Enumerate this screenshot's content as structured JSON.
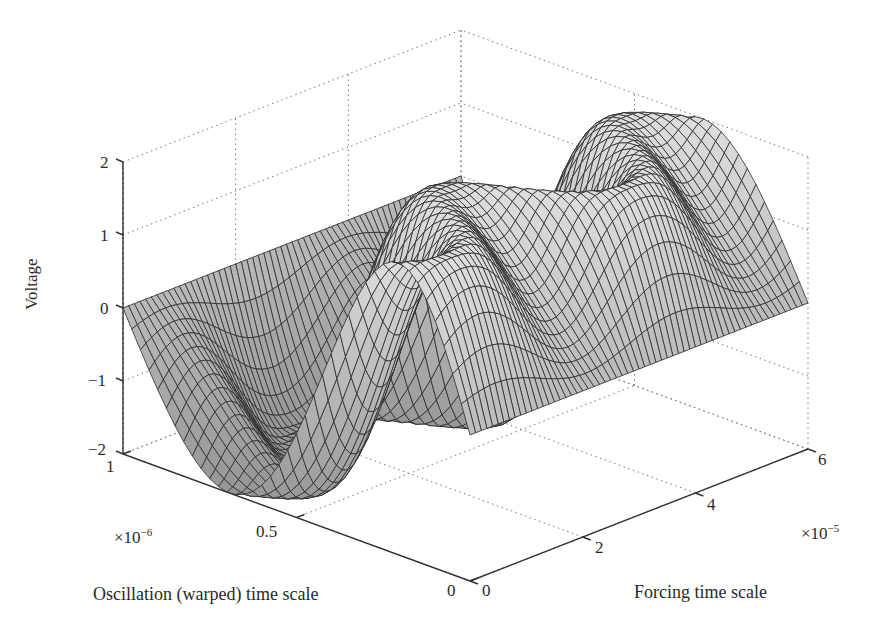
{
  "chart_data": {
    "type": "surface3d",
    "title": "",
    "xlabel": "Forcing time scale",
    "ylabel": "Oscillation (warped) time scale",
    "zlabel": "Voltage",
    "x_multiplier": "×10",
    "x_multiplier_exp": "−5",
    "y_multiplier": "×10",
    "y_multiplier_exp": "−6",
    "xlim": [
      0,
      6
    ],
    "ylim": [
      0,
      1
    ],
    "zlim": [
      -2,
      2
    ],
    "x_ticks": [
      "0",
      "2",
      "4",
      "6"
    ],
    "y_ticks": [
      "0",
      "0.5",
      "1"
    ],
    "z_ticks": [
      "−2",
      "−1",
      "0",
      "1",
      "2"
    ],
    "grid": "dotted",
    "surface": {
      "description": "Voltage = A·sin(2π·(y + w·sin(πy)·sin(2π·x/Px)))",
      "amplitude": 2,
      "warp": 0.18,
      "forcing_period": 3.2,
      "forcing_phase": 0.4,
      "x_samples": 60,
      "y_samples": 40,
      "face_color": "#c8c8c8",
      "edge_color": "#2b2b2b"
    }
  },
  "ticks": {
    "z": [
      "2",
      "1",
      "0",
      "−1",
      "−2"
    ],
    "y": [
      "1",
      "0.5",
      "0"
    ],
    "x": [
      "0",
      "2",
      "4",
      "6"
    ]
  },
  "labels": {
    "zlabel": "Voltage",
    "ylabel": "Oscillation (warped) time scale",
    "xlabel": "Forcing time scale",
    "ymult_base": "×10",
    "ymult_exp": "−6",
    "xmult_base": "×10",
    "xmult_exp": "−5"
  }
}
